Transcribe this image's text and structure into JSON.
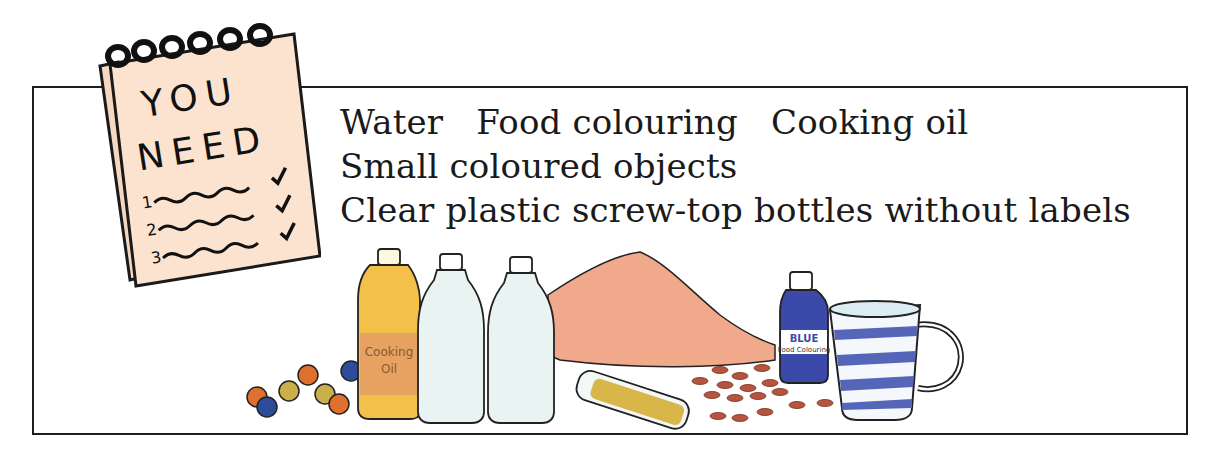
{
  "notepad": {
    "title_line1": "YOU",
    "title_line2": "NEED",
    "items": [
      {
        "number": "1",
        "checked": true
      },
      {
        "number": "2",
        "checked": true
      },
      {
        "number": "3",
        "checked": true
      }
    ],
    "paper_color": "#fbe3cf"
  },
  "materials": {
    "lines": [
      "Water   Food colouring   Cooking oil",
      "Small coloured objects",
      "Clear plastic screw-top bottles without labels"
    ],
    "items": [
      "Water",
      "Food colouring",
      "Cooking oil",
      "Small coloured objects",
      "Clear plastic screw-top bottles without labels"
    ]
  },
  "illustration": {
    "oil_bottle_label_line1": "Cooking",
    "oil_bottle_label_line2": "Oil",
    "food_colouring_label_line1": "BLUE",
    "food_colouring_label_line2": "Food Colouring",
    "colors": {
      "oil": "#f3c04a",
      "oil_label": "#e7a160",
      "sand": "#f0a98a",
      "blue": "#3b4aa8",
      "bead_orange": "#e0702e",
      "bead_yellow": "#c9b04a",
      "bead_blue": "#2f4c9a",
      "sequin": "#b5553f",
      "glass": "#e8f3f2"
    }
  }
}
